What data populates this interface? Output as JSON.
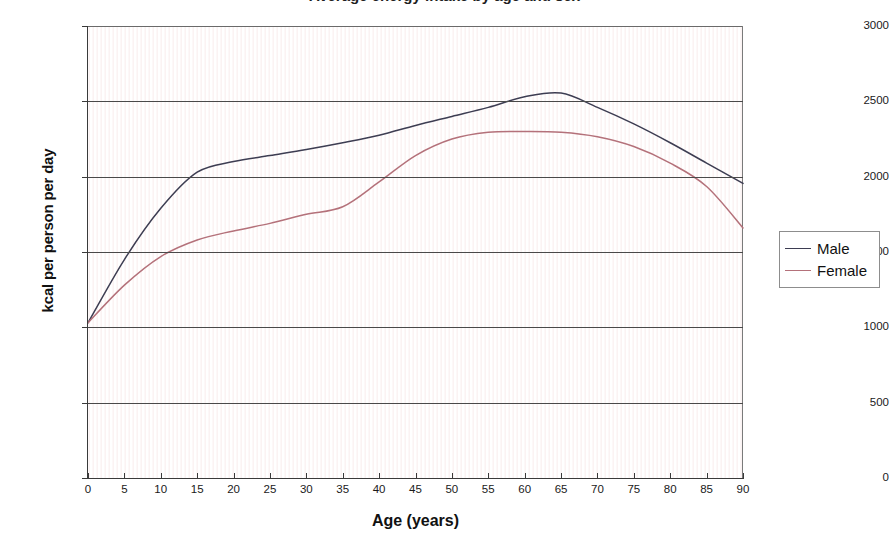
{
  "chart_data": {
    "type": "line",
    "title": "Average energy intake by age and sex",
    "xlabel": "Age (years)",
    "ylabel": "kcal per person per day",
    "xlim": [
      0,
      90
    ],
    "ylim": [
      0,
      3000
    ],
    "xticks": [
      0,
      5,
      10,
      15,
      20,
      25,
      30,
      35,
      40,
      45,
      50,
      55,
      60,
      65,
      70,
      75,
      80,
      85,
      90
    ],
    "yticks": [
      0,
      500,
      1000,
      1500,
      2000,
      2500,
      3000
    ],
    "grid": "horizontal",
    "legend_position": "right-outside",
    "x": [
      0,
      5,
      10,
      15,
      20,
      25,
      30,
      35,
      40,
      45,
      50,
      55,
      60,
      65,
      70,
      75,
      80,
      85,
      90
    ],
    "series": [
      {
        "name": "Male",
        "color": "#3d3d52",
        "values": [
          1030,
          1450,
          1790,
          2030,
          2100,
          2140,
          2180,
          2225,
          2275,
          2340,
          2400,
          2460,
          2530,
          2555,
          2460,
          2350,
          2225,
          2090,
          1955
        ]
      },
      {
        "name": "Female",
        "color": "#b4717a",
        "values": [
          1030,
          1280,
          1470,
          1580,
          1640,
          1690,
          1750,
          1800,
          1965,
          2140,
          2250,
          2295,
          2300,
          2295,
          2265,
          2200,
          2090,
          1935,
          1660
        ]
      }
    ]
  },
  "axes": {
    "y_title": "kcal per person per day",
    "x_title": "Age (years)",
    "y_tick_labels": [
      "3000",
      "2500",
      "2000",
      "1500",
      "1000",
      "500",
      "0"
    ],
    "x_tick_labels": [
      "0",
      "5",
      "10",
      "15",
      "20",
      "25",
      "30",
      "35",
      "40",
      "45",
      "50",
      "55",
      "60",
      "65",
      "70",
      "75",
      "80",
      "85",
      "90"
    ]
  },
  "legend": {
    "entries": [
      {
        "label": "Male",
        "color": "#3d3d52"
      },
      {
        "label": "Female",
        "color": "#b4717a"
      }
    ]
  },
  "colors": {
    "male": "#3d3d52",
    "female": "#b4717a",
    "gridline": "#4a4a4a",
    "axis": "#3a3a3a",
    "plot_background": "#fdf9f9"
  }
}
